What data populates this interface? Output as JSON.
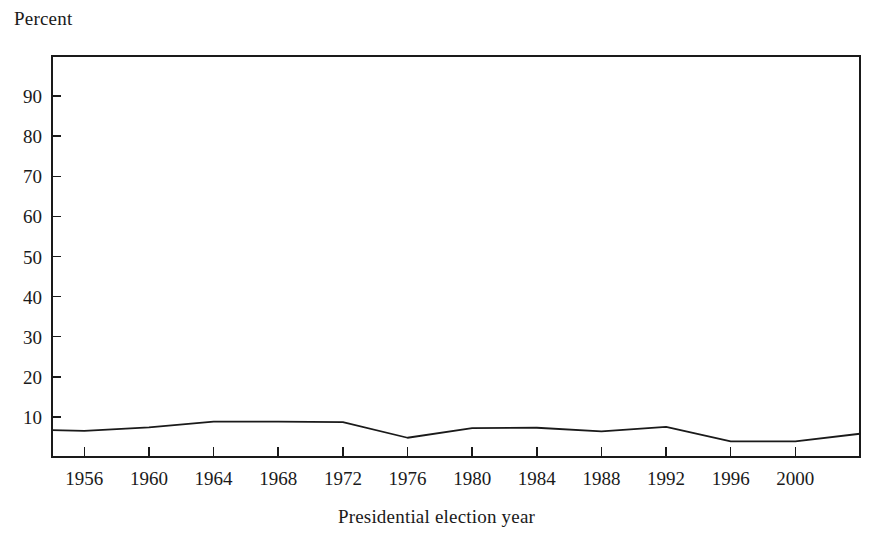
{
  "chart_data": {
    "type": "line",
    "title": "",
    "xlabel": "Presidential election year",
    "ylabel": "Percent",
    "ylim": [
      0,
      100
    ],
    "xlim": [
      1954,
      2004
    ],
    "yticks": [
      10,
      20,
      30,
      40,
      50,
      60,
      70,
      80,
      90
    ],
    "ytick_labels": [
      "10",
      "20",
      "30",
      "40",
      "50",
      "60",
      "70",
      "80",
      "90"
    ],
    "xticks": [
      1956,
      1960,
      1964,
      1968,
      1972,
      1976,
      1980,
      1984,
      1988,
      1992,
      1996,
      2000,
      2004
    ],
    "xtick_labels": [
      "1956",
      "1960",
      "1964",
      "1968",
      "1972",
      "1976",
      "1980",
      "1984",
      "1988",
      "1992",
      "1996",
      "2000",
      ""
    ],
    "grid": false,
    "legend": null,
    "line_color": "#1a1a1a",
    "series": [
      {
        "name": "Percent",
        "x": [
          1954,
          1956,
          1960,
          1964,
          1968,
          1972,
          1976,
          1980,
          1984,
          1988,
          1992,
          1996,
          2000,
          2004
        ],
        "values": [
          6.7,
          6.5,
          7.4,
          8.8,
          8.8,
          8.7,
          4.8,
          7.2,
          7.3,
          6.4,
          7.5,
          3.9,
          3.9,
          5.8
        ]
      }
    ]
  },
  "axes": {
    "y_unit_label": "Percent",
    "x_title": "Presidential election year"
  }
}
